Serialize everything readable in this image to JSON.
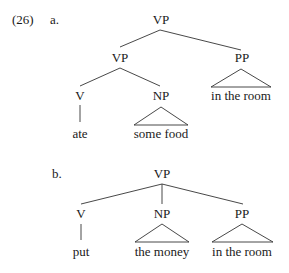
{
  "example": {
    "number": "(26)",
    "a": {
      "label": "a.",
      "root": "VP",
      "inner_vp": "VP",
      "pp": "PP",
      "pp_text": "in the room",
      "v": "V",
      "v_text": "ate",
      "np": "NP",
      "np_text": "some food"
    },
    "b": {
      "label": "b.",
      "root": "VP",
      "v": "V",
      "v_text": "put",
      "np": "NP",
      "np_text": "the money",
      "pp": "PP",
      "pp_text": "in the room"
    }
  }
}
